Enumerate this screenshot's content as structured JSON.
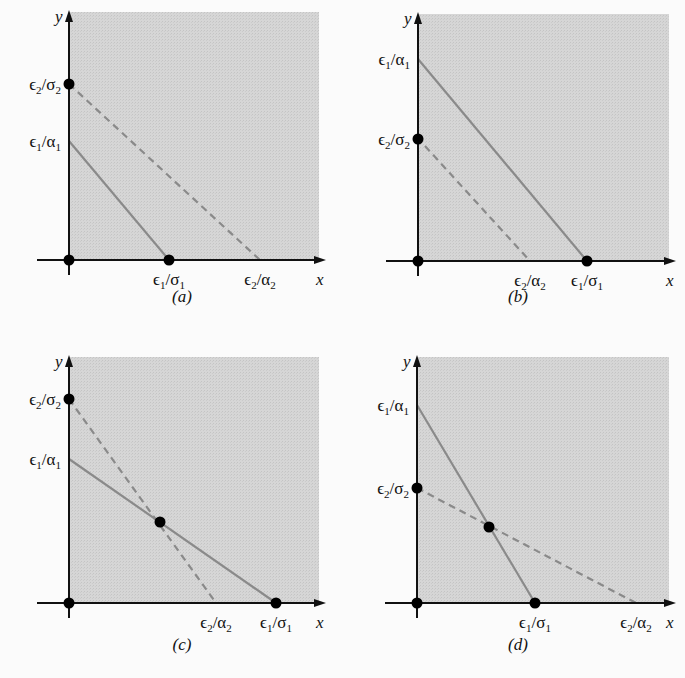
{
  "figure": {
    "axis_labels": {
      "x": "x",
      "y": "y"
    },
    "colors": {
      "shade": "#d4d4d4",
      "line": "#8a8a8a",
      "axis": "#111111",
      "dot": "#000000"
    },
    "panels": [
      {
        "id": "a",
        "caption": "(a)",
        "origin": [
          69,
          260
        ],
        "ytop": 10,
        "xright": 326,
        "ticks_y": [
          {
            "label": "ϵ",
            "sub1": "2",
            "sep": "/σ",
            "sub2": "2",
            "y": 84,
            "dot": true
          },
          {
            "label": "ϵ",
            "sub1": "1",
            "sep": "/α",
            "sub2": "1",
            "y": 141,
            "dot": false
          }
        ],
        "ticks_x": [
          {
            "label": "ϵ",
            "sub1": "1",
            "sep": "/σ",
            "sub2": "1",
            "x": 169,
            "dot": true
          },
          {
            "label": "ϵ",
            "sub1": "2",
            "sep": "/α",
            "sub2": "2",
            "x": 260,
            "dot": false
          }
        ],
        "solid": [
          [
            69,
            141
          ],
          [
            169,
            260
          ]
        ],
        "dashed": [
          [
            69,
            84
          ],
          [
            260,
            260
          ]
        ],
        "intersection": null
      },
      {
        "id": "b",
        "caption": "(b)",
        "origin": [
          418,
          261
        ],
        "ytop": 12,
        "xright": 676,
        "ticks_y": [
          {
            "label": "ϵ",
            "sub1": "1",
            "sep": "/α",
            "sub2": "1",
            "y": 59,
            "dot": false
          },
          {
            "label": "ϵ",
            "sub1": "2",
            "sep": "/σ",
            "sub2": "2",
            "y": 139,
            "dot": true
          }
        ],
        "ticks_x": [
          {
            "label": "ϵ",
            "sub1": "2",
            "sep": "/α",
            "sub2": "2",
            "x": 530,
            "dot": false
          },
          {
            "label": "ϵ",
            "sub1": "1",
            "sep": "/σ",
            "sub2": "1",
            "x": 587,
            "dot": true
          }
        ],
        "solid": [
          [
            418,
            59
          ],
          [
            587,
            261
          ]
        ],
        "dashed": [
          [
            425,
            146
          ],
          [
            530,
            261
          ]
        ],
        "intersection": null
      },
      {
        "id": "c",
        "caption": "(c)",
        "origin": [
          69,
          603
        ],
        "ytop": 355,
        "xright": 326,
        "ticks_y": [
          {
            "label": "ϵ",
            "sub1": "2",
            "sep": "/σ",
            "sub2": "2",
            "y": 399,
            "dot": true
          },
          {
            "label": "ϵ",
            "sub1": "1",
            "sep": "/α",
            "sub2": "1",
            "y": 459,
            "dot": false
          }
        ],
        "ticks_x": [
          {
            "label": "ϵ",
            "sub1": "2",
            "sep": "/α",
            "sub2": "2",
            "x": 216,
            "dot": false
          },
          {
            "label": "ϵ",
            "sub1": "1",
            "sep": "/σ",
            "sub2": "1",
            "x": 276,
            "dot": true
          }
        ],
        "solid": [
          [
            69,
            459
          ],
          [
            276,
            603
          ]
        ],
        "dashed": [
          [
            69,
            399
          ],
          [
            216,
            603
          ]
        ],
        "intersection": [
          160,
          522
        ]
      },
      {
        "id": "d",
        "caption": "(d)",
        "origin": [
          417,
          603
        ],
        "ytop": 355,
        "xright": 676,
        "ticks_y": [
          {
            "label": "ϵ",
            "sub1": "1",
            "sep": "/α",
            "sub2": "1",
            "y": 405,
            "dot": false
          },
          {
            "label": "ϵ",
            "sub1": "2",
            "sep": "/σ",
            "sub2": "2",
            "y": 488,
            "dot": true
          }
        ],
        "ticks_x": [
          {
            "label": "ϵ",
            "sub1": "1",
            "sep": "/σ",
            "sub2": "1",
            "x": 535,
            "dot": true
          },
          {
            "label": "ϵ",
            "sub1": "2",
            "sep": "/α",
            "sub2": "2",
            "x": 636,
            "dot": false
          }
        ],
        "solid": [
          [
            417,
            405
          ],
          [
            535,
            603
          ]
        ],
        "dashed": [
          [
            417,
            488
          ],
          [
            636,
            603
          ]
        ],
        "intersection": [
          489,
          527
        ]
      }
    ]
  }
}
